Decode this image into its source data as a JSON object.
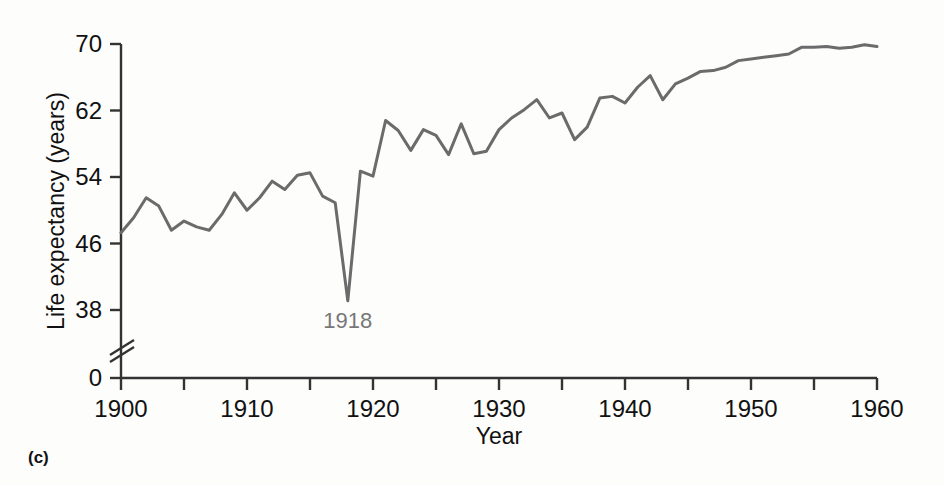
{
  "figure": {
    "panel_label": "(c)",
    "background_color": "#fdfdfc"
  },
  "chart_data": {
    "type": "line",
    "title": "",
    "xlabel": "Year",
    "ylabel": "Life expectancy (years)",
    "xlim": [
      1900,
      1960
    ],
    "ylim": [
      34.5,
      70.5
    ],
    "y_axis_break": true,
    "y_axis_break_note": "axis broken between 0 and 38",
    "grid": false,
    "legend": null,
    "line_color": "#6b6b6b",
    "axis_color": "#333333",
    "xticks_major": [
      1900,
      1910,
      1920,
      1930,
      1940,
      1950,
      1960
    ],
    "xtick_labels": [
      "1900",
      "1910",
      "1920",
      "1930",
      "1940",
      "1950",
      "1960"
    ],
    "xticks_minor": [
      1905,
      1915,
      1925,
      1935,
      1945,
      1955
    ],
    "yticks": [
      0,
      38,
      46,
      54,
      62,
      70
    ],
    "ytick_labels": [
      "0",
      "38",
      "46",
      "54",
      "62",
      "70"
    ],
    "annotations": [
      {
        "text": "1918",
        "x": 1918,
        "y": 39.2,
        "color": "#777777",
        "position": "below"
      }
    ],
    "x": [
      1900,
      1901,
      1902,
      1903,
      1904,
      1905,
      1906,
      1907,
      1908,
      1909,
      1910,
      1911,
      1912,
      1913,
      1914,
      1915,
      1916,
      1917,
      1918,
      1919,
      1920,
      1921,
      1922,
      1923,
      1924,
      1925,
      1926,
      1927,
      1928,
      1929,
      1930,
      1931,
      1932,
      1933,
      1934,
      1935,
      1936,
      1937,
      1938,
      1939,
      1940,
      1941,
      1942,
      1943,
      1944,
      1945,
      1946,
      1947,
      1948,
      1949,
      1950,
      1951,
      1952,
      1953,
      1954,
      1955,
      1956,
      1957,
      1958,
      1959,
      1960
    ],
    "values": [
      47.3,
      49.1,
      51.5,
      50.5,
      47.6,
      48.7,
      48.0,
      47.6,
      49.5,
      52.1,
      50.0,
      51.5,
      53.5,
      52.5,
      54.2,
      54.5,
      51.7,
      50.9,
      39.1,
      54.7,
      54.1,
      60.8,
      59.6,
      57.2,
      59.7,
      59.0,
      56.7,
      60.4,
      56.8,
      57.1,
      59.7,
      61.1,
      62.1,
      63.3,
      61.1,
      61.7,
      58.5,
      60.0,
      63.5,
      63.7,
      62.9,
      64.8,
      66.2,
      63.3,
      65.2,
      65.9,
      66.7,
      66.8,
      67.2,
      68.0,
      68.2,
      68.4,
      68.6,
      68.8,
      69.6,
      69.6,
      69.7,
      69.5,
      69.6,
      69.9,
      69.7
    ]
  },
  "axis_geometry": {
    "plot_left": 121,
    "plot_right": 877,
    "y_70": 44,
    "y_62": 110,
    "y_54": 177,
    "y_46": 243,
    "y_38": 310,
    "y_zero": 378
  }
}
